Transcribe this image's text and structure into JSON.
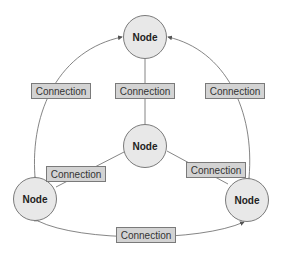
{
  "diagram": {
    "type": "network",
    "nodes": [
      {
        "id": "top",
        "label": "Node"
      },
      {
        "id": "center",
        "label": "Node"
      },
      {
        "id": "bottom-left",
        "label": "Node"
      },
      {
        "id": "bottom-right",
        "label": "Node"
      }
    ],
    "connections": [
      {
        "from": "bottom-left",
        "to": "top",
        "label": "Connection",
        "arrow": "both"
      },
      {
        "from": "center",
        "to": "top",
        "label": "Connection",
        "arrow": "none"
      },
      {
        "from": "bottom-right",
        "to": "top",
        "label": "Connection",
        "arrow": "both"
      },
      {
        "from": "center",
        "to": "bottom-left",
        "label": "Connection",
        "arrow": "none"
      },
      {
        "from": "center",
        "to": "bottom-right",
        "label": "Connection",
        "arrow": "none"
      },
      {
        "from": "bottom-left",
        "to": "bottom-right",
        "label": "Connection",
        "arrow": "both"
      }
    ],
    "colors": {
      "node_fill": "#e8e8e8",
      "label_fill": "#d3d3d3",
      "stroke": "#7a7a7a"
    }
  }
}
